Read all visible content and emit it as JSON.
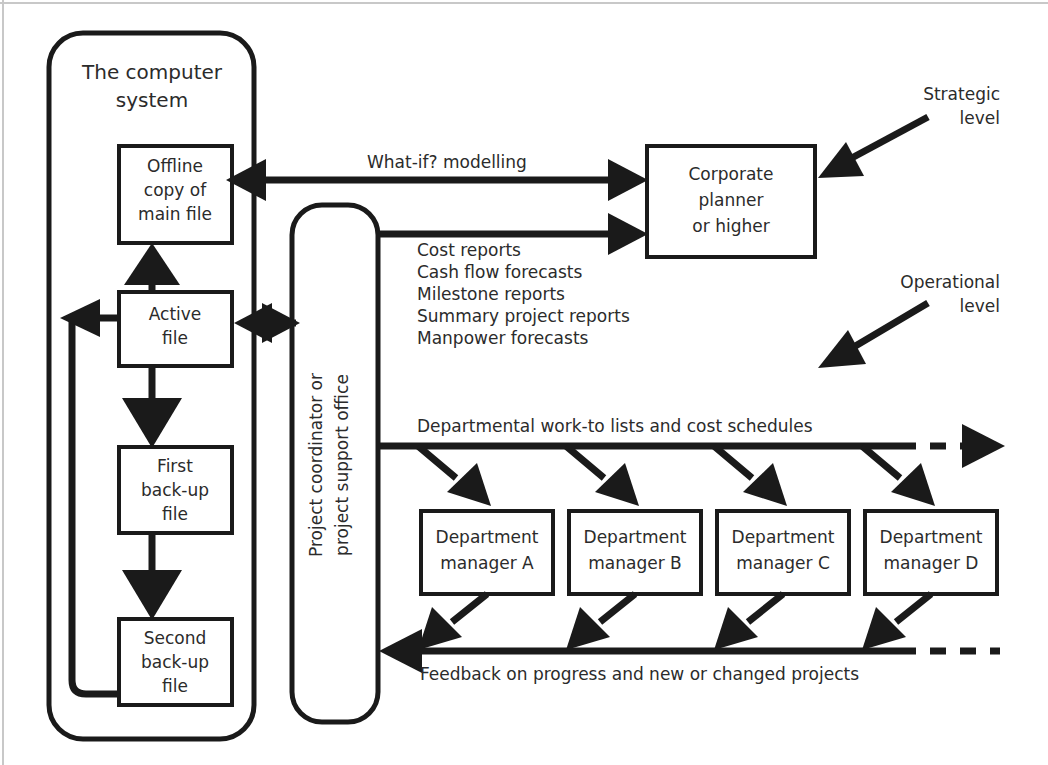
{
  "diagram": {
    "title_hidden": "Project control information flow diagram",
    "containers": {
      "computer_system": {
        "label": "The computer system"
      },
      "coordinator": {
        "label_line1": "Project coordinator or",
        "label_line2": "project support office"
      }
    },
    "nodes": {
      "offline_copy": {
        "line1": "Offline",
        "line2": "copy of",
        "line3": "main file"
      },
      "active_file": {
        "line1": "Active",
        "line2": "file"
      },
      "first_backup": {
        "line1": "First",
        "line2": "back-up",
        "line3": "file"
      },
      "second_backup": {
        "line1": "Second",
        "line2": "back-up",
        "line3": "file"
      },
      "corporate_planner": {
        "line1": "Corporate",
        "line2": "planner",
        "line3": "or higher"
      },
      "dept_a": {
        "line1": "Department",
        "line2": "manager A"
      },
      "dept_b": {
        "line1": "Department",
        "line2": "manager B"
      },
      "dept_c": {
        "line1": "Department",
        "line2": "manager C"
      },
      "dept_d": {
        "line1": "Department",
        "line2": "manager D"
      }
    },
    "flow_labels": {
      "what_if": "What-if? modelling",
      "reports": [
        "Cost reports",
        "Cash flow forecasts",
        "Milestone reports",
        "Summary project reports",
        "Manpower forecasts"
      ],
      "work_to_lists": "Departmental work-to lists and cost schedules",
      "feedback": "Feedback on progress and new or changed projects"
    },
    "annotations": {
      "strategic": {
        "line1": "Strategic",
        "line2": "level"
      },
      "operational": {
        "line1": "Operational",
        "line2": "level"
      }
    },
    "colors": {
      "ink": "#1a1a1a",
      "text": "#2b2b2b",
      "page": "#ffffff",
      "frame": "#c8c8c8"
    }
  }
}
